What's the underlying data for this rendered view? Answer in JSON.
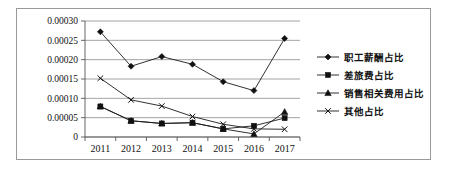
{
  "chart_data": {
    "type": "line",
    "title": "",
    "xlabel": "",
    "ylabel": "",
    "categories": [
      "2011",
      "2012",
      "2013",
      "2014",
      "2015",
      "2016",
      "2017"
    ],
    "ylim": [
      0,
      0.0003
    ],
    "ytick_labels": [
      "0.00030",
      "0.00025",
      "0.00020",
      "0.00015",
      "0.00010",
      "0.00005",
      "0"
    ],
    "ytick_values": [
      0.0003,
      0.00025,
      0.0002,
      0.00015,
      0.0001,
      5e-05,
      0
    ],
    "grid": "horizontal",
    "legend_position": "right",
    "series": [
      {
        "name": "职工薪酬占比",
        "marker": "diamond",
        "values": [
          0.000272,
          0.000183,
          0.000208,
          0.000188,
          0.000143,
          0.00012,
          0.000255
        ]
      },
      {
        "name": "差旅费占比",
        "marker": "square",
        "values": [
          7.9e-05,
          4.2e-05,
          3.5e-05,
          3.7e-05,
          2.1e-05,
          2.9e-05,
          4.9e-05
        ]
      },
      {
        "name": "销售相关费用占比",
        "marker": "triangle",
        "values": [
          7.9e-05,
          4.2e-05,
          3.5e-05,
          3.7e-05,
          2.1e-05,
          8e-06,
          6.5e-05
        ]
      },
      {
        "name": "其他占比",
        "marker": "x",
        "values": [
          0.000152,
          9.6e-05,
          8e-05,
          5.3e-05,
          3.3e-05,
          2.1e-05,
          2e-05
        ]
      }
    ]
  },
  "legend": {
    "items": [
      {
        "label": "职工薪酬占比",
        "marker": "diamond"
      },
      {
        "label": "差旅费占比",
        "marker": "square"
      },
      {
        "label": "销售相关费用占比",
        "marker": "triangle"
      },
      {
        "label": "其他占比",
        "marker": "x"
      }
    ]
  },
  "colors": {
    "series": "#111111",
    "gridline": "#8c8c8c",
    "border": "#9a9a9a",
    "background": "#ffffff"
  }
}
